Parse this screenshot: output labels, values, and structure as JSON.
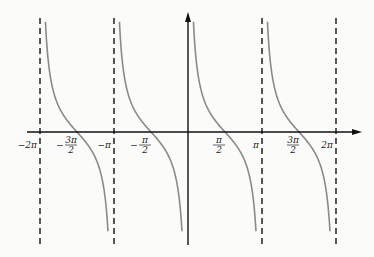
{
  "chart_data": {
    "type": "line",
    "title": "",
    "function": "cot(x)",
    "xlabel": "",
    "ylabel": "",
    "xlim": [
      -2.15,
      2.35
    ],
    "xlim_units": "multiples of pi",
    "ylim": [
      -6,
      6
    ],
    "grid": false,
    "legend": "none",
    "asymptotes_pi": [
      -2,
      -1,
      1,
      2
    ],
    "branches_pi": [
      [
        -2,
        -1
      ],
      [
        -1,
        0
      ],
      [
        0,
        1
      ],
      [
        1,
        2
      ]
    ],
    "zeros_pi": [
      -1.5,
      -0.5,
      0.5,
      1.5
    ],
    "ticks": [
      {
        "value_pi": -2,
        "label": "−2π"
      },
      {
        "value_pi": -1.5,
        "label": "−3π/2",
        "num": "3π",
        "den": "2",
        "sign": "−"
      },
      {
        "value_pi": -1,
        "label": "−π"
      },
      {
        "value_pi": -0.5,
        "label": "−π/2",
        "num": "π",
        "den": "2",
        "sign": "−"
      },
      {
        "value_pi": 0.5,
        "label": "π/2",
        "num": "π",
        "den": "2",
        "sign": ""
      },
      {
        "value_pi": 1,
        "label": "π"
      },
      {
        "value_pi": 1.5,
        "label": "3π/2",
        "num": "3π",
        "den": "2",
        "sign": ""
      },
      {
        "value_pi": 2,
        "label": "2π"
      }
    ],
    "colors": {
      "curve": "#8a8a8a",
      "axis": "#111111",
      "asymptote": "#111111"
    }
  }
}
